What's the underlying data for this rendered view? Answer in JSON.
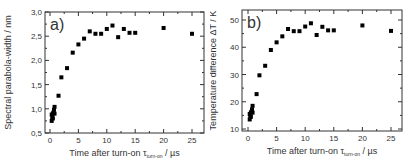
{
  "chart_data": [
    {
      "type": "scatter",
      "panel_label": "a)",
      "title": "",
      "xlabel": "Time after turn-on τ_turn-on / µs",
      "xlabel_main": "Time after turn-on τ",
      "xlabel_sub": "turn-on",
      "xlabel_unit": " / µs",
      "ylabel": "Spectral parabola-width / nm",
      "xlim": [
        -1,
        27
      ],
      "ylim": [
        0.5,
        3.0
      ],
      "xticks": [
        0,
        5,
        10,
        15,
        20,
        25
      ],
      "xtick_labels": [
        "0",
        "5",
        "10",
        "15",
        "20",
        "25"
      ],
      "yticks": [
        0.5,
        1.0,
        1.5,
        2.0,
        2.5,
        3.0
      ],
      "ytick_labels": [
        "0,5",
        "1,0",
        "1,5",
        "2,0",
        "2,5",
        "3,0"
      ],
      "grid": false,
      "legend": null,
      "marker": "square",
      "series": [
        {
          "name": "parabola-width",
          "x": [
            0.3,
            0.3,
            0.4,
            0.5,
            0.5,
            0.6,
            0.7,
            0.8,
            0.8,
            1.5,
            2,
            3,
            4,
            5,
            6,
            7,
            8,
            9,
            10,
            11,
            12,
            13,
            14,
            15,
            20,
            25
          ],
          "y": [
            0.75,
            0.88,
            0.82,
            0.8,
            0.9,
            0.92,
            0.98,
            0.9,
            1.04,
            1.27,
            1.65,
            1.84,
            2.16,
            2.33,
            2.45,
            2.6,
            2.55,
            2.55,
            2.65,
            2.72,
            2.48,
            2.65,
            2.57,
            2.57,
            2.67,
            2.55
          ]
        }
      ]
    },
    {
      "type": "scatter",
      "panel_label": "b)",
      "title": "",
      "xlabel": "Time after turn-on τ_turn-on / µs",
      "xlabel_main": "Time after turn-on τ",
      "xlabel_sub": "turn-on",
      "xlabel_unit": " / µs",
      "ylabel": "Temperature difference ΔT / K",
      "xlim": [
        -1,
        27
      ],
      "ylim": [
        9,
        54
      ],
      "xticks": [
        0,
        5,
        10,
        15,
        20,
        25
      ],
      "xtick_labels": [
        "0",
        "5",
        "10",
        "15",
        "20",
        "25"
      ],
      "yticks": [
        10,
        20,
        30,
        40,
        50
      ],
      "ytick_labels": [
        "10",
        "20",
        "30",
        "40",
        "50"
      ],
      "grid": false,
      "legend": null,
      "marker": "square",
      "series": [
        {
          "name": "temperature difference",
          "x": [
            0.3,
            0.3,
            0.4,
            0.5,
            0.5,
            0.6,
            0.7,
            0.8,
            0.8,
            1.5,
            2,
            3,
            4,
            5,
            6,
            7,
            8,
            9,
            10,
            11,
            12,
            13,
            14,
            15,
            20,
            25
          ],
          "y": [
            13.5,
            15.5,
            14.5,
            14.5,
            16,
            16.3,
            17.2,
            16,
            18.5,
            22.8,
            29.7,
            33.2,
            39,
            41.8,
            44,
            46.7,
            45.9,
            45.9,
            47.6,
            48.8,
            44.5,
            47.5,
            46.2,
            46.2,
            48,
            46
          ]
        }
      ]
    }
  ]
}
